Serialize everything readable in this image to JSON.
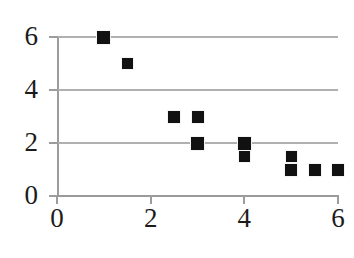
{
  "chart_data": {
    "type": "scatter",
    "title": "",
    "subtitle": "",
    "xlabel": "",
    "ylabel": "",
    "xlim": [
      0,
      6
    ],
    "ylim": [
      0,
      6
    ],
    "x_ticks": [
      0,
      2,
      4,
      6
    ],
    "y_ticks": [
      0,
      2,
      4,
      6
    ],
    "x_tick_labels": [
      "0",
      "2",
      "4",
      "6"
    ],
    "y_tick_labels": [
      "0",
      "2",
      "4",
      "6"
    ],
    "grid": true,
    "grid_axis": "y",
    "grid_values": [
      0,
      2,
      4,
      6
    ],
    "legend": false,
    "legend_position": "none",
    "marker": "square",
    "marker_color": "#111111",
    "points": [
      {
        "x": 1,
        "y": 6,
        "size": 13
      },
      {
        "x": 1.5,
        "y": 5,
        "size": 11
      },
      {
        "x": 2.5,
        "y": 3,
        "size": 12
      },
      {
        "x": 3,
        "y": 3,
        "size": 12
      },
      {
        "x": 3,
        "y": 2,
        "size": 13
      },
      {
        "x": 4,
        "y": 2,
        "size": 13
      },
      {
        "x": 4,
        "y": 1.5,
        "size": 11
      },
      {
        "x": 5,
        "y": 1.5,
        "size": 11
      },
      {
        "x": 5,
        "y": 1,
        "size": 12
      },
      {
        "x": 5.5,
        "y": 1,
        "size": 12
      },
      {
        "x": 6,
        "y": 1,
        "size": 12
      }
    ]
  },
  "axes": {
    "grid_color": "#b0b0b0",
    "axis_color": "#9c9c9c",
    "background": "#ffffff",
    "text_color": "#1b1b1b"
  },
  "geometry": {
    "x0_px": 57,
    "x6_px": 338,
    "y0_px": 196,
    "y6_px": 37
  }
}
